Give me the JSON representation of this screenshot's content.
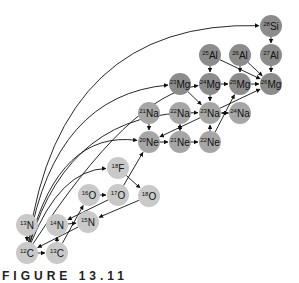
{
  "diagram": {
    "colors": {
      "light": "#c9c9c9",
      "medium": "#a6a6a6",
      "dark": "#8c8c8c",
      "arrow": "#111111"
    },
    "radius": 11,
    "nodes": [
      {
        "id": "12C",
        "mass": "12",
        "el": "C",
        "x": 27,
        "y": 253,
        "shade": "light"
      },
      {
        "id": "13C",
        "mass": "13",
        "el": "C",
        "x": 57,
        "y": 253,
        "shade": "light"
      },
      {
        "id": "13N",
        "mass": "13",
        "el": "N",
        "x": 27,
        "y": 225,
        "shade": "light"
      },
      {
        "id": "14N",
        "mass": "14",
        "el": "N",
        "x": 57,
        "y": 225,
        "shade": "light"
      },
      {
        "id": "15N",
        "mass": "15",
        "el": "N",
        "x": 88,
        "y": 222,
        "shade": "light"
      },
      {
        "id": "16O",
        "mass": "16",
        "el": "O",
        "x": 89,
        "y": 195,
        "shade": "light"
      },
      {
        "id": "17O",
        "mass": "17",
        "el": "O",
        "x": 118,
        "y": 195,
        "shade": "light"
      },
      {
        "id": "18O",
        "mass": "18",
        "el": "O",
        "x": 149,
        "y": 196,
        "shade": "light"
      },
      {
        "id": "18F",
        "mass": "18",
        "el": "F",
        "x": 118,
        "y": 168,
        "shade": "light"
      },
      {
        "id": "20Ne",
        "mass": "20",
        "el": "Ne",
        "x": 149,
        "y": 142,
        "shade": "medium"
      },
      {
        "id": "21Ne",
        "mass": "21",
        "el": "Ne",
        "x": 180,
        "y": 142,
        "shade": "medium"
      },
      {
        "id": "22Ne",
        "mass": "22",
        "el": "Ne",
        "x": 210,
        "y": 142,
        "shade": "medium"
      },
      {
        "id": "21Na",
        "mass": "21",
        "el": "Na",
        "x": 149,
        "y": 113,
        "shade": "medium"
      },
      {
        "id": "22Na",
        "mass": "22",
        "el": "Na",
        "x": 180,
        "y": 113,
        "shade": "medium"
      },
      {
        "id": "23Na",
        "mass": "23",
        "el": "Na",
        "x": 210,
        "y": 113,
        "shade": "medium"
      },
      {
        "id": "24Na",
        "mass": "24",
        "el": "Na",
        "x": 240,
        "y": 113,
        "shade": "medium"
      },
      {
        "id": "23Mg",
        "mass": "23",
        "el": "Mg",
        "x": 180,
        "y": 84,
        "shade": "dark"
      },
      {
        "id": "24Mg",
        "mass": "24",
        "el": "Mg",
        "x": 210,
        "y": 84,
        "shade": "dark"
      },
      {
        "id": "25Mg",
        "mass": "25",
        "el": "Mg",
        "x": 240,
        "y": 84,
        "shade": "dark"
      },
      {
        "id": "26Mg",
        "mass": "26",
        "el": "Mg",
        "x": 271,
        "y": 84,
        "shade": "dark"
      },
      {
        "id": "25Al",
        "mass": "25",
        "el": "Al",
        "x": 210,
        "y": 55,
        "shade": "dark"
      },
      {
        "id": "26Al",
        "mass": "26",
        "el": "Al",
        "x": 240,
        "y": 55,
        "shade": "dark"
      },
      {
        "id": "27Al",
        "mass": "27",
        "el": "Al",
        "x": 271,
        "y": 55,
        "shade": "dark"
      },
      {
        "id": "28Si",
        "mass": "28",
        "el": "Si",
        "x": 271,
        "y": 26,
        "shade": "dark"
      }
    ],
    "straight_edges": [
      [
        "12C",
        "13C"
      ],
      [
        "13N",
        "12C"
      ],
      [
        "13C",
        "14N"
      ],
      [
        "14N",
        "15N"
      ],
      [
        "15N",
        "12C"
      ],
      [
        "16O",
        "17O"
      ],
      [
        "17O",
        "14N"
      ],
      [
        "13C",
        "16O"
      ],
      [
        "17O",
        "20Ne"
      ],
      [
        "18F",
        "18O"
      ],
      [
        "18O",
        "15N"
      ],
      [
        "20Ne",
        "21Ne"
      ],
      [
        "21Na",
        "20Ne"
      ],
      [
        "21Ne",
        "22Na"
      ],
      [
        "22Na",
        "21Ne"
      ],
      [
        "22Ne",
        "23Na"
      ],
      [
        "23Na",
        "24Na"
      ],
      [
        "24Na",
        "23Na"
      ],
      [
        "23Na",
        "20Ne"
      ],
      [
        "24Mg",
        "23Na"
      ],
      [
        "23Na",
        "26Mg"
      ],
      [
        "22Ne",
        "25Mg"
      ],
      [
        "24Mg",
        "25Mg"
      ],
      [
        "25Mg",
        "26Mg"
      ],
      [
        "25Al",
        "24Mg"
      ],
      [
        "26Al",
        "25Mg"
      ],
      [
        "25Al",
        "26Mg"
      ],
      [
        "26Al",
        "26Mg"
      ],
      [
        "27Al",
        "26Mg"
      ],
      [
        "28Si",
        "27Al"
      ],
      [
        "21Ne",
        "22Ne"
      ],
      [
        "23Mg",
        "23Na"
      ]
    ],
    "curved_edges": [
      {
        "from": "12C",
        "to": "28Si",
        "cx": 60,
        "cy": 20
      },
      {
        "from": "12C",
        "to": "23Mg",
        "cx": 55,
        "cy": 95
      },
      {
        "from": "12C",
        "to": "20Ne",
        "cx": 60,
        "cy": 130
      },
      {
        "from": "12C",
        "to": "23Na",
        "cx": 70,
        "cy": 110
      },
      {
        "from": "12C",
        "to": "18F",
        "cx": 60,
        "cy": 170
      },
      {
        "from": "12C",
        "to": "24Mg",
        "cx": 130,
        "cy": 95
      }
    ]
  },
  "caption": "FIGURE 13.11"
}
